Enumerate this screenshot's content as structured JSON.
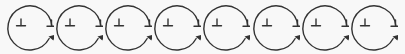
{
  "diagram": {
    "colors": {
      "stroke": "#333333",
      "background": "#f8f8f8"
    },
    "cycles": [
      {
        "inner_symbol": "⊥",
        "end_symbol": "⊥",
        "arrow": "arrowhead"
      },
      {
        "inner_symbol": "⊥",
        "end_symbol": "⊥",
        "arrow": "arrowhead"
      },
      {
        "inner_symbol": "⊥",
        "end_symbol": "⊥",
        "arrow": "arrowhead"
      },
      {
        "inner_symbol": "⊥",
        "end_symbol": "⊥",
        "arrow": "arrowhead"
      },
      {
        "inner_symbol": "⊥",
        "end_symbol": "⊥",
        "arrow": "arrowhead"
      },
      {
        "inner_symbol": "⊥",
        "end_symbol": "⊥",
        "arrow": "arrowhead"
      },
      {
        "inner_symbol": "⊥",
        "end_symbol": "⊥",
        "arrow": "arrowhead"
      },
      {
        "inner_symbol": "⊥",
        "end_symbol": "⊥",
        "arrow": "arrowhead"
      }
    ]
  }
}
